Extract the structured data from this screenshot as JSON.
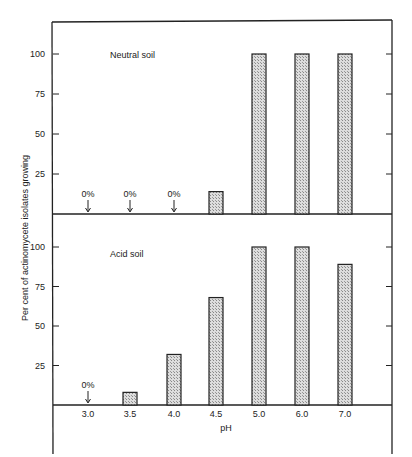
{
  "chart_data": {
    "type": "bar",
    "xlabel": "pH",
    "ylabel": "Per cent of actinomycete isolates growing",
    "categories": [
      "3.0",
      "3.5",
      "4.0",
      "4.5",
      "5.0",
      "6.0",
      "7.0"
    ],
    "ylim": [
      0,
      120
    ],
    "yticks": [
      25,
      50,
      75,
      100
    ],
    "grid": false,
    "panels": [
      {
        "title": "Neutral soil",
        "values": [
          0,
          0,
          0,
          14,
          100,
          100,
          100
        ],
        "annotations": [
          {
            "category": "3.0",
            "label": "0%"
          },
          {
            "category": "3.5",
            "label": "0%"
          },
          {
            "category": "4.0",
            "label": "0%"
          }
        ]
      },
      {
        "title": "Acid soil",
        "values": [
          0,
          8,
          32,
          68,
          100,
          100,
          89
        ],
        "annotations": [
          {
            "category": "3.0",
            "label": "0%"
          }
        ]
      }
    ]
  }
}
